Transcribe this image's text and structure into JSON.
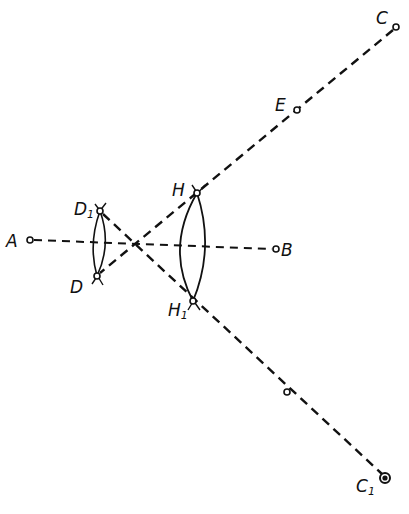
{
  "diagram": {
    "type": "geometric-construction",
    "points": {
      "A": {
        "label": "A",
        "x": 30,
        "y": 240
      },
      "B": {
        "label": "B",
        "x": 276,
        "y": 249
      },
      "C": {
        "label": "C",
        "x": 396,
        "y": 27
      },
      "E": {
        "label": "E",
        "x": 297,
        "y": 110
      },
      "H": {
        "label": "H",
        "x": 197,
        "y": 193
      },
      "H1": {
        "label": "H",
        "sub": "1",
        "x": 193,
        "y": 301
      },
      "D": {
        "label": "D",
        "x": 97,
        "y": 276
      },
      "D1": {
        "label": "D",
        "sub": "1",
        "x": 100,
        "y": 211
      },
      "M": {
        "label": "",
        "x": 287,
        "y": 392
      },
      "C1": {
        "label": "C",
        "sub": "1",
        "x": 385,
        "y": 478
      },
      "X": {
        "label": "",
        "x": 136,
        "y": 244
      }
    },
    "lines": [
      {
        "from": "A",
        "to": "B",
        "style": "dashed"
      },
      {
        "from": "C",
        "to": "D",
        "style": "dashed"
      },
      {
        "from": "D1",
        "to": "C1",
        "style": "dashed"
      }
    ],
    "arcs": [
      {
        "between": [
          "D1",
          "D"
        ],
        "note": "small lens"
      },
      {
        "between": [
          "H",
          "H1"
        ],
        "note": "large lens"
      }
    ]
  }
}
